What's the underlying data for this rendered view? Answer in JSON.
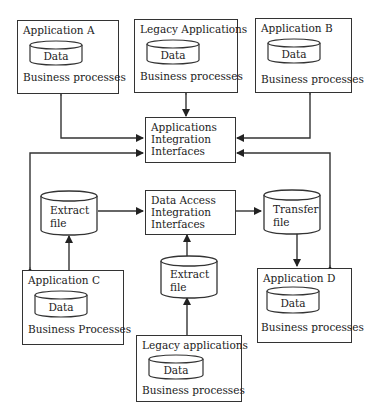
{
  "diagram": {
    "nodes": {
      "app_a": {
        "title": "Application A",
        "data": "Data",
        "processes": "Business processes"
      },
      "legacy_top": {
        "title": "Legacy Applications",
        "data": "Data",
        "processes": "Business processes"
      },
      "app_b": {
        "title": "Application B",
        "data": "Data",
        "processes": "Business processes"
      },
      "aii": {
        "line1": "Applications",
        "line2": "Integration",
        "line3": "Interfaces"
      },
      "extract_left": {
        "line1": "Extract",
        "line2": "file"
      },
      "daii": {
        "line1": "Data Access",
        "line2": "Integration",
        "line3": "Interfaces"
      },
      "transfer": {
        "line1": "Transfer",
        "line2": "file"
      },
      "app_c": {
        "title": "Application C",
        "data": "Data",
        "processes": "Business Processes"
      },
      "extract_bottom": {
        "line1": "Extract",
        "line2": "file"
      },
      "app_d": {
        "title": "Application D",
        "data": "Data",
        "processes": "Business processes"
      },
      "legacy_bottom": {
        "title": "Legacy applications",
        "data": "Data",
        "processes": "Business processes"
      }
    },
    "edges": [
      {
        "from": "Application A",
        "to": "Applications Integration Interfaces",
        "direction": "both"
      },
      {
        "from": "Legacy Applications",
        "to": "Applications Integration Interfaces",
        "direction": "both"
      },
      {
        "from": "Application B",
        "to": "Applications Integration Interfaces",
        "direction": "both"
      },
      {
        "from": "Application C",
        "to": "Applications Integration Interfaces",
        "direction": "both"
      },
      {
        "from": "Application D",
        "to": "Applications Integration Interfaces",
        "direction": "both"
      },
      {
        "from": "Application C",
        "to": "Extract file (left)",
        "direction": "forward"
      },
      {
        "from": "Extract file (left)",
        "to": "Data Access Integration Interfaces",
        "direction": "forward"
      },
      {
        "from": "Legacy applications (bottom)",
        "to": "Extract file (bottom)",
        "direction": "forward"
      },
      {
        "from": "Extract file (bottom)",
        "to": "Data Access Integration Interfaces",
        "direction": "forward"
      },
      {
        "from": "Data Access Integration Interfaces",
        "to": "Transfer file",
        "direction": "forward"
      },
      {
        "from": "Transfer file",
        "to": "Application D",
        "direction": "forward"
      }
    ],
    "colors": {
      "line": "#333333",
      "background": "#ffffff",
      "text": "#222222"
    }
  }
}
